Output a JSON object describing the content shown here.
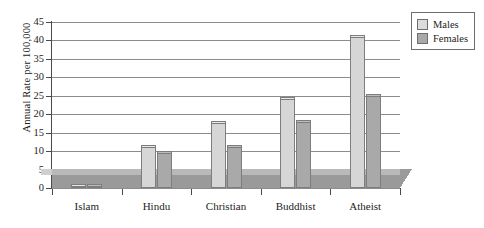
{
  "chart_data": {
    "type": "bar",
    "title": "",
    "subtitle": "",
    "xlabel": "",
    "ylabel": "Annual Rate per 100,000",
    "categories": [
      "Islam",
      "Hindu",
      "Christian",
      "Buddhist",
      "Atheist"
    ],
    "series": [
      {
        "name": "Males",
        "color": "#d6d6d6",
        "values": [
          0.5,
          11,
          17.5,
          24,
          41
        ]
      },
      {
        "name": "Females",
        "color": "#a9a9a9",
        "values": [
          0.5,
          9.5,
          11,
          18,
          25
        ]
      }
    ],
    "ylim": [
      0,
      45
    ],
    "ytick_step": 5,
    "ytick_labels": [
      "0",
      "5",
      "10",
      "15",
      "20",
      "25",
      "30",
      "35",
      "40",
      "45"
    ],
    "grid": true,
    "grid_axis": "y",
    "legend_position": "top-right",
    "style": "3d-grayscale",
    "floor_height_units": 3.5
  },
  "legend": {
    "items": [
      {
        "label": "Males"
      },
      {
        "label": "Females"
      }
    ]
  },
  "colors": {
    "males": "#d6d6d6",
    "females": "#a9a9a9",
    "floor_top": "#b9b9b9",
    "floor_front": "#9a9a9a",
    "gridline": "#8c8c8c",
    "axis": "#4a4a4a",
    "text": "#1d1d1d"
  }
}
